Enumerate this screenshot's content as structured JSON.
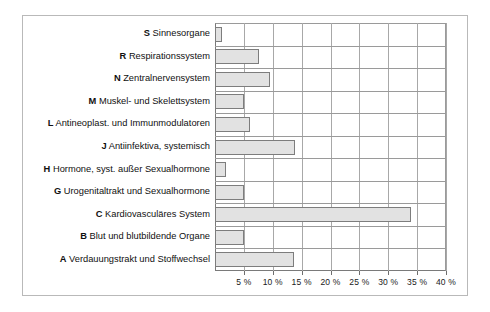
{
  "chart_data": {
    "type": "bar",
    "orientation": "horizontal",
    "title": "",
    "xlabel": "",
    "ylabel": "",
    "grid": true,
    "legend": false,
    "xlim": [
      0,
      40
    ],
    "xticks": [
      5,
      10,
      15,
      20,
      25,
      30,
      35,
      40
    ],
    "xtick_labels": [
      "5 %",
      "10 %",
      "15 %",
      "20 %",
      "25 %",
      "30 %",
      "35 %",
      "40 %"
    ],
    "categories": [
      "S Sinnesorgane",
      "R Respirationssystem",
      "N Zentralnervensystem",
      "M Muskel- und Skelettsystem",
      "L Antineoplast. und Immunmodulatoren",
      "J Antiinfektiva, systemisch",
      "H Hormone, syst. außer Sexualhormone",
      "G Urogenitaltrakt und Sexualhormone",
      "C Kardiovasculäres System",
      "B Blut und blutbildende Organe",
      "A Verdauungstrakt und Stoffwechsel"
    ],
    "category_codes": [
      "S",
      "R",
      "N",
      "M",
      "L",
      "J",
      "H",
      "G",
      "C",
      "B",
      "A"
    ],
    "category_names": [
      "Sinnesorgane",
      "Respirationssystem",
      "Zentralnervensystem",
      "Muskel- und Skelettsystem",
      "Antineoplast. und Immunmodulatoren",
      "Antiinfektiva, systemisch",
      "Hormone, syst. außer Sexualhormone",
      "Urogenitaltrakt und Sexualhormone",
      "Kardiovasculäres System",
      "Blut und blutbildende Organe",
      "Verdauungstrakt und Stoffwechsel"
    ],
    "values": [
      1.2,
      7.7,
      9.5,
      5.0,
      6.1,
      13.8,
      1.9,
      5.0,
      34.0,
      5.0,
      13.6
    ],
    "bar_fill": "#e2e2e2",
    "bar_edge": "#7d7d7d",
    "grid_color": "#a8a8a8",
    "frame_color": "#b9b9b9"
  }
}
